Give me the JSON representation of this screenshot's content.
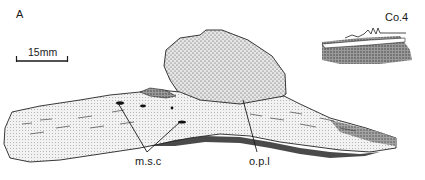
{
  "figure": {
    "panel_label": "A",
    "scale_bar": {
      "label": "15mm"
    },
    "inset": {
      "label": "Co.4"
    },
    "annotations": [
      {
        "id": "msc",
        "label": "m.s.c"
      },
      {
        "id": "opl",
        "label": "o.p.l"
      }
    ],
    "colors": {
      "ink": "#1a1a1a",
      "stipple": "#555555",
      "bone_fill": "#e8e8e8",
      "background": "#ffffff"
    }
  }
}
